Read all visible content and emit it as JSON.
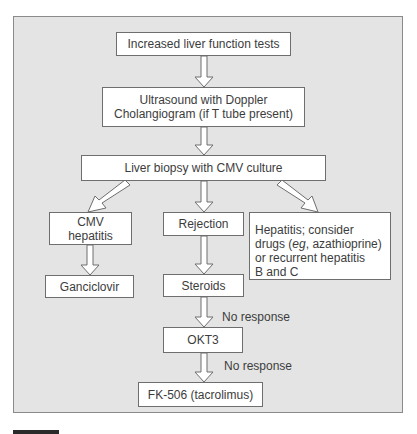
{
  "diagram": {
    "type": "flowchart",
    "nodes": {
      "lft": "Increased liver function tests",
      "ultrasound": "Ultrasound with Doppler\nCholangiogram (if T tube present)",
      "biopsy": "Liver biopsy with CMV culture",
      "cmv": "CMV\nhepatitis",
      "rejection": "Rejection",
      "hepatitis_pre": "Hepatitis;  consider\ndrugs (",
      "hepatitis_em": "eg",
      "hepatitis_post": ", azathioprine)\nor recurrent hepatitis\nB and C",
      "ganciclovir": "Ganciclovir",
      "steroids": "Steroids",
      "okt3": "OKT3",
      "fk506": "FK-506 (tacrolimus)"
    },
    "edge_labels": {
      "steroids_to_okt3": "No response",
      "okt3_to_fk506": "No response"
    },
    "edges": [
      [
        "lft",
        "ultrasound"
      ],
      [
        "ultrasound",
        "biopsy"
      ],
      [
        "biopsy",
        "cmv"
      ],
      [
        "biopsy",
        "rejection"
      ],
      [
        "biopsy",
        "hepatitis"
      ],
      [
        "cmv",
        "ganciclovir"
      ],
      [
        "rejection",
        "steroids"
      ],
      [
        "steroids",
        "okt3"
      ],
      [
        "okt3",
        "fk506"
      ]
    ]
  }
}
